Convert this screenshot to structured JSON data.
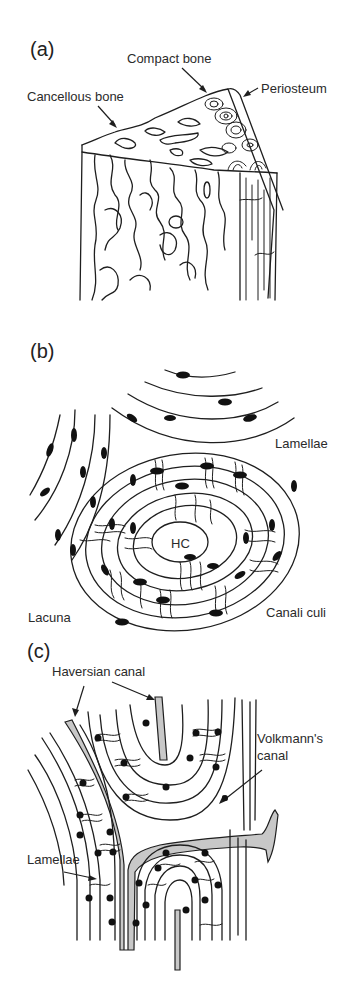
{
  "figure": {
    "panels": [
      {
        "letter": "(a)",
        "labels": {
          "compact_bone": "Compact bone",
          "cancellous_bone": "Cancellous bone",
          "periosteum": "Periosteum"
        }
      },
      {
        "letter": "(b)",
        "labels": {
          "lamellae": "Lamellae",
          "hc": "HC",
          "lacuna": "Lacuna",
          "canaliculi": "Canali culi"
        }
      },
      {
        "letter": "(c)",
        "labels": {
          "haversian_canal": "Haversian canal",
          "volkmanns_canal_line1": "Volkmann's",
          "volkmanns_canal_line2": "canal",
          "lamellae": "Lamellae"
        }
      }
    ],
    "colors": {
      "line": "#1e1e1e",
      "canal_fill": "#c8c8c8",
      "background": "#ffffff"
    }
  }
}
